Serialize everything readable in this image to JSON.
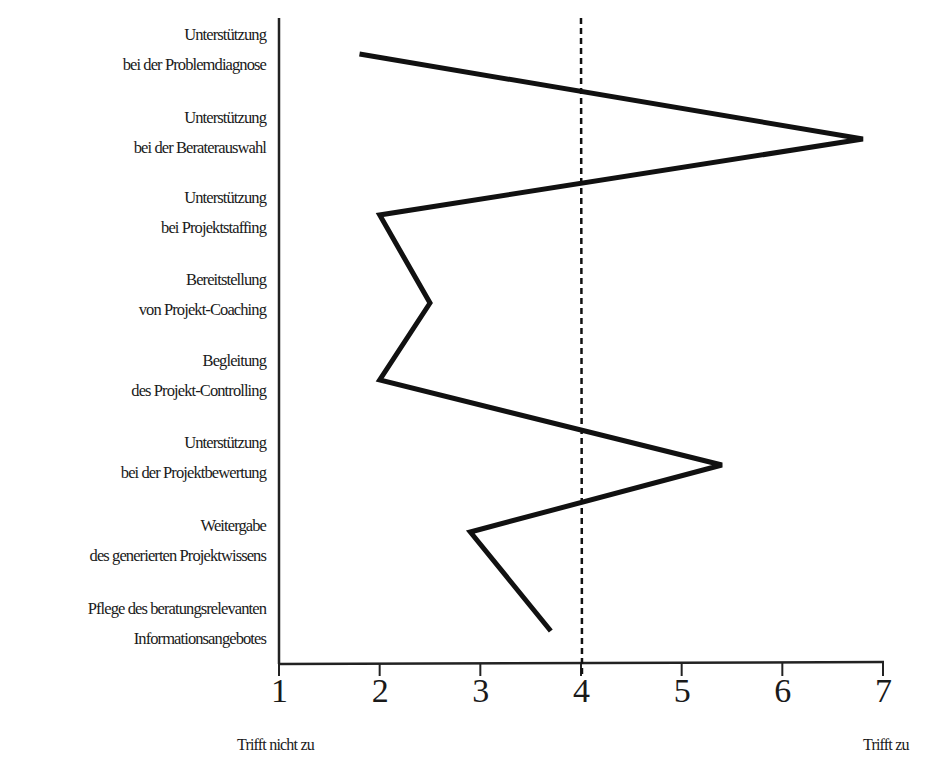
{
  "chart_data": {
    "type": "line",
    "orientation": "horizontal-profile",
    "title": "",
    "xlabel": "",
    "ylabel": "",
    "x_range": [
      1,
      7
    ],
    "x_ticks": [
      "1",
      "2",
      "3",
      "4",
      "5",
      "6",
      "7"
    ],
    "x_scale_labels": {
      "left": "Trifft nicht zu",
      "right": "Trifft zu"
    },
    "reference_line": {
      "value": 4,
      "style": "dashed"
    },
    "grid": false,
    "legend": null,
    "categories": [
      {
        "line1": "Unterstützung",
        "line2": "bei der Problemdiagnose"
      },
      {
        "line1": "Unterstützung",
        "line2": "bei der Beraterauswahl"
      },
      {
        "line1": "Unterstützung",
        "line2": "bei Projektstaffing"
      },
      {
        "line1": "Bereitstellung",
        "line2": "von Projekt-Coaching"
      },
      {
        "line1": "Begleitung",
        "line2": "des Projekt-Controlling"
      },
      {
        "line1": "Unterstützung",
        "line2": "bei der Projektbewertung"
      },
      {
        "line1": "Weitergabe",
        "line2": "des generierten Projektwissens"
      },
      {
        "line1": "Pflege des beratungsrelevanten",
        "line2": "Informationsangebotes"
      }
    ],
    "values": [
      1.8,
      6.8,
      2.0,
      2.5,
      2.0,
      5.4,
      2.9,
      3.7
    ]
  },
  "colors": {
    "line": "#111111",
    "axis": "#222222",
    "background": "#ffffff"
  }
}
